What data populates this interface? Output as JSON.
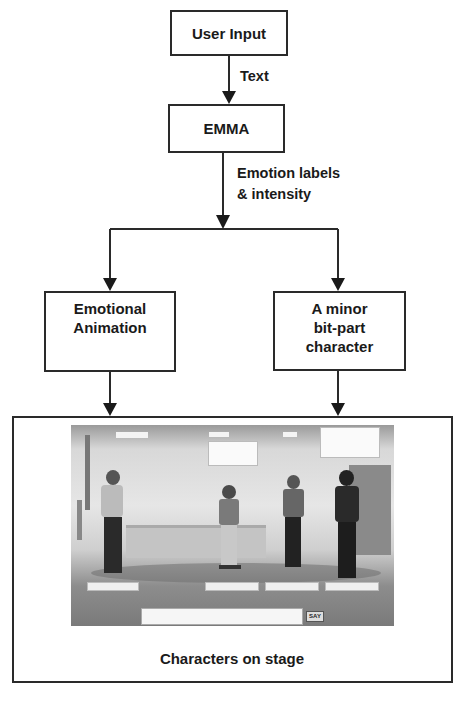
{
  "nodes": {
    "user_input": "User Input",
    "emma": "EMMA",
    "emotional_animation": [
      "Emotional",
      "Animation"
    ],
    "bit_part": [
      "A minor",
      "bit-part",
      "character"
    ],
    "stage_caption": "Characters on stage"
  },
  "edges": {
    "input_to_emma": "Text",
    "emma_to_split": [
      "Emotion labels",
      "& intensity"
    ]
  },
  "scene": {
    "say_button": "SAY",
    "chat_prefix": "> ",
    "name_tags": 4,
    "speech_bubbles": 2,
    "characters": 4
  },
  "colors": {
    "line": "#2a2a2a",
    "text": "#1a1a1a",
    "background": "#ffffff"
  }
}
